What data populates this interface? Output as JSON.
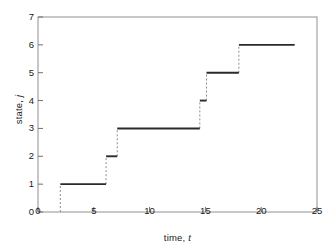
{
  "chart_data": {
    "type": "line",
    "subtype": "step-post",
    "title": "",
    "xlabel": "time, t",
    "xlabel_plain": "time,",
    "xlabel_italic": "t",
    "ylabel": "state, j",
    "ylabel_plain": "state,",
    "ylabel_italic": "j",
    "xlim": [
      0,
      25
    ],
    "ylim": [
      0,
      7
    ],
    "xticks": [
      0,
      5,
      10,
      15,
      20,
      25
    ],
    "yticks": [
      0,
      1,
      2,
      3,
      4,
      5,
      6,
      7
    ],
    "xtick_labels": [
      "0",
      "5",
      "10",
      "15",
      "20",
      "25"
    ],
    "ytick_labels": [
      "0",
      "1",
      "2",
      "3",
      "4",
      "5",
      "6",
      "7"
    ],
    "grid": false,
    "legend": false,
    "frame": true,
    "series": [
      {
        "name": "state trajectory",
        "jump_times": [
          2.0,
          6.1,
          7.1,
          14.5,
          15.1,
          18.0
        ],
        "states_after_jump": [
          1,
          2,
          3,
          4,
          5,
          6
        ],
        "end_time": 23.0,
        "points": [
          {
            "t": 2.0,
            "j": 0
          },
          {
            "t": 2.0,
            "j": 1
          },
          {
            "t": 6.1,
            "j": 1
          },
          {
            "t": 6.1,
            "j": 2
          },
          {
            "t": 7.1,
            "j": 2
          },
          {
            "t": 7.1,
            "j": 3
          },
          {
            "t": 14.5,
            "j": 3
          },
          {
            "t": 14.5,
            "j": 4
          },
          {
            "t": 15.1,
            "j": 4
          },
          {
            "t": 15.1,
            "j": 5
          },
          {
            "t": 18.0,
            "j": 5
          },
          {
            "t": 18.0,
            "j": 6
          },
          {
            "t": 23.0,
            "j": 6
          }
        ],
        "horizontal_segments": [
          {
            "j": 1,
            "t_start": 2.0,
            "t_end": 6.1
          },
          {
            "j": 2,
            "t_start": 6.1,
            "t_end": 7.1
          },
          {
            "j": 3,
            "t_start": 7.1,
            "t_end": 14.5
          },
          {
            "j": 4,
            "t_start": 14.5,
            "t_end": 15.1
          },
          {
            "j": 5,
            "t_start": 15.1,
            "t_end": 18.0
          },
          {
            "j": 6,
            "t_start": 18.0,
            "t_end": 23.0
          }
        ],
        "vertical_segments": [
          {
            "t": 2.0,
            "j_start": 0,
            "j_end": 1
          },
          {
            "t": 6.1,
            "j_start": 1,
            "j_end": 2
          },
          {
            "t": 7.1,
            "j_start": 2,
            "j_end": 3
          },
          {
            "t": 14.5,
            "j_start": 3,
            "j_end": 4
          },
          {
            "t": 15.1,
            "j_start": 4,
            "j_end": 5
          },
          {
            "t": 18.0,
            "j_start": 5,
            "j_end": 6
          }
        ],
        "horizontal_style": "solid",
        "vertical_style": "dashed",
        "color": "#2b2b2b"
      }
    ],
    "colors": {
      "line": "#2b2b2b",
      "dashed": "#8c8c8c",
      "axis": "#707070",
      "text": "#1a1a1a",
      "background": "#ffffff"
    }
  }
}
